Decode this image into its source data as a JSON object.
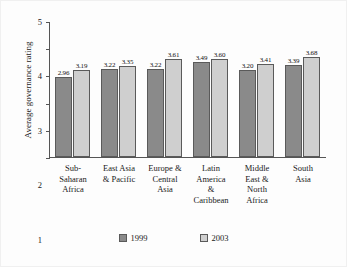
{
  "chart_data": {
    "type": "bar",
    "title": "",
    "xlabel": "",
    "ylabel": "Average governance rating",
    "ylim": [
      0,
      5
    ],
    "yticks": [
      "5",
      "4",
      "3",
      "2",
      "1",
      "0"
    ],
    "grid": false,
    "legend_position": "bottom",
    "categories": [
      "Sub-Saharan Africa",
      "East Asia & Pacific",
      "Europe & Central Asia",
      "Latin America & Caribbean",
      "Middle East & North Africa",
      "South Asia"
    ],
    "category_lines": [
      [
        "Sub-",
        "Saharan",
        "Africa"
      ],
      [
        "East Asia",
        "& Pacific"
      ],
      [
        "Europe &",
        "Central",
        "Asia"
      ],
      [
        "Latin",
        "America",
        "&",
        "Caribbean"
      ],
      [
        "Middle",
        "East &",
        "North",
        "Africa"
      ],
      [
        "South",
        "Asia"
      ]
    ],
    "series": [
      {
        "name": "1999",
        "color": "#8a8a8a",
        "values": [
          2.96,
          3.22,
          3.22,
          3.49,
          3.2,
          3.39
        ],
        "labels": [
          "2.96",
          "3.22",
          "3.22",
          "3.49",
          "3.20",
          "3.39"
        ]
      },
      {
        "name": "2003",
        "color": "#cfcfcf",
        "values": [
          3.19,
          3.35,
          3.61,
          3.6,
          3.41,
          3.68
        ],
        "labels": [
          "3.19",
          "3.35",
          "3.61",
          "3.60",
          "3.41",
          "3.68"
        ]
      }
    ]
  },
  "legend": {
    "entries": [
      {
        "label": "1999",
        "color": "#8a8a8a"
      },
      {
        "label": "2003",
        "color": "#cfcfcf"
      }
    ]
  }
}
